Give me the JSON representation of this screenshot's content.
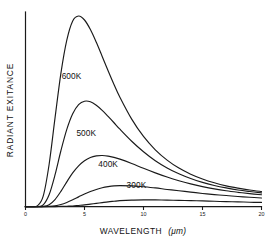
{
  "chart_data": {
    "type": "line",
    "title": "",
    "subtitle": "",
    "xlabel_text": "WAVELENGTH",
    "xlabel_unit": "(μm)",
    "ylabel": "RADIANT  EXITANCE",
    "xlim": [
      0,
      20
    ],
    "ylim": [
      0,
      1.0
    ],
    "x_ticks": [
      "0",
      "5",
      "10",
      "15",
      "20"
    ],
    "x_tick_values": [
      0,
      5,
      10,
      15,
      20
    ],
    "y_ticks": [],
    "grid": false,
    "legend_position": "inline-curve-labels",
    "annotations": [
      "700K",
      "600K",
      "500K",
      "400K",
      "300K"
    ],
    "line_color": "#1a1a1a",
    "background_color": "#ffffff",
    "axis_color": "#1a1a1a",
    "x": [
      0.0,
      0.5,
      1.0,
      1.5,
      2.0,
      2.5,
      3.0,
      3.5,
      4.0,
      4.5,
      5.0,
      5.5,
      6.0,
      6.5,
      7.0,
      7.5,
      8.0,
      9.0,
      10.0,
      11.0,
      12.0,
      13.0,
      14.0,
      15.0,
      16.0,
      17.0,
      18.0,
      19.0,
      20.0
    ],
    "series": [
      {
        "name": "700K",
        "label": "700K",
        "peak_x": 4.14,
        "peak_y": 1.0,
        "label_x": 3.1,
        "label_y": 1.12,
        "values": [
          0.0,
          0.0,
          0.004,
          0.055,
          0.221,
          0.464,
          0.699,
          0.873,
          0.974,
          1.0,
          0.979,
          0.929,
          0.862,
          0.788,
          0.713,
          0.641,
          0.574,
          0.459,
          0.368,
          0.298,
          0.244,
          0.202,
          0.17,
          0.145,
          0.125,
          0.109,
          0.097,
          0.087,
          0.079
        ]
      },
      {
        "name": "600K",
        "label": "600K",
        "peak_x": 4.83,
        "peak_y": 0.555,
        "label_x": 3.9,
        "label_y": 0.672,
        "values": [
          0.0,
          0.0,
          0.0,
          0.009,
          0.062,
          0.166,
          0.293,
          0.405,
          0.487,
          0.535,
          0.553,
          0.55,
          0.532,
          0.505,
          0.473,
          0.44,
          0.406,
          0.343,
          0.288,
          0.241,
          0.203,
          0.172,
          0.147,
          0.127,
          0.111,
          0.098,
          0.087,
          0.079,
          0.072
        ]
      },
      {
        "name": "500K",
        "label": "500K",
        "peak_x": 5.8,
        "peak_y": 0.268,
        "label_x": 5.15,
        "label_y": 0.372,
        "values": [
          0.0,
          0.0,
          0.0,
          0.001,
          0.01,
          0.037,
          0.08,
          0.13,
          0.177,
          0.214,
          0.241,
          0.258,
          0.266,
          0.268,
          0.265,
          0.258,
          0.249,
          0.226,
          0.201,
          0.177,
          0.155,
          0.136,
          0.119,
          0.105,
          0.093,
          0.083,
          0.075,
          0.068,
          0.062
        ]
      },
      {
        "name": "400K",
        "label": "400K",
        "peak_x": 7.25,
        "peak_y": 0.11,
        "label_x": 7.0,
        "label_y": 0.206,
        "values": [
          0.0,
          0.0,
          0.0,
          0.0,
          0.001,
          0.004,
          0.011,
          0.022,
          0.036,
          0.051,
          0.066,
          0.079,
          0.09,
          0.099,
          0.105,
          0.109,
          0.11,
          0.109,
          0.104,
          0.098,
          0.09,
          0.083,
          0.076,
          0.069,
          0.063,
          0.058,
          0.053,
          0.049,
          0.045
        ]
      },
      {
        "name": "300K",
        "label": "300K",
        "peak_x": 9.66,
        "peak_y": 0.035,
        "label_x": 9.4,
        "label_y": 0.098,
        "values": [
          0.0,
          0.0,
          0.0,
          0.0,
          0.0,
          0.0,
          0.001,
          0.002,
          0.003,
          0.006,
          0.009,
          0.013,
          0.017,
          0.021,
          0.025,
          0.028,
          0.031,
          0.034,
          0.035,
          0.035,
          0.034,
          0.033,
          0.031,
          0.03,
          0.028,
          0.026,
          0.025,
          0.023,
          0.022
        ]
      }
    ]
  }
}
